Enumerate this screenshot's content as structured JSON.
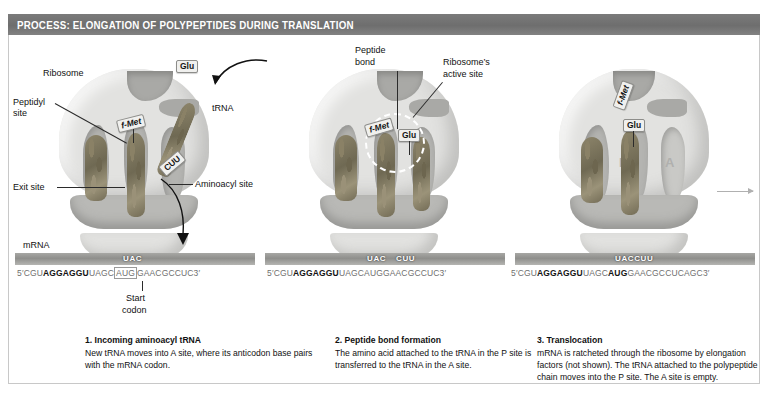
{
  "header": {
    "title": "PROCESS: ELONGATION OF POLYPEPTIDES DURING TRANSLATION"
  },
  "sites": {
    "e": "E",
    "p": "P",
    "a": "A"
  },
  "panel1": {
    "labels": {
      "ribosome": "Ribosome",
      "peptidyl_site_line1": "Peptidyl",
      "peptidyl_site_line2": "site",
      "exit_site": "Exit site",
      "mrna": "mRNA",
      "trna": "tRNA",
      "aminoacyl_site": "Aminoacyl site",
      "start_codon_line1": "Start",
      "start_codon_line2": "codon"
    },
    "amino_acids": {
      "fmet": "f-Met",
      "glu": "Glu"
    },
    "anticodons": {
      "p_site": "UAC",
      "incoming": "CUU"
    },
    "mrna_sequence": {
      "five_prime": "5′",
      "leader": "CGU",
      "shine_dalgarno": "AGGAGGU",
      "spacer": "UAGC",
      "start_codon": "AUG",
      "tail": "GAACGCCUC",
      "three_prime": "3′"
    },
    "caption_title": "1. Incoming aminoacyl tRNA",
    "caption_body": "New tRNA moves into A site, where its anticodon base pairs with the mRNA codon."
  },
  "panel2": {
    "labels": {
      "peptide_bond_line1": "Peptide",
      "peptide_bond_line2": "bond",
      "active_site_line1": "Ribosome’s",
      "active_site_line2": "active site"
    },
    "amino_acids": {
      "fmet": "f-Met",
      "glu": "Glu"
    },
    "anticodons": {
      "p_site": "UAC",
      "a_site": "CUU"
    },
    "mrna_sequence": {
      "five_prime": "5′",
      "leader": "CGU",
      "shine_dalgarno": "AGGAGGU",
      "spacer": "UAGC",
      "start_codon": "AUG",
      "tail": "GAACGCCUC",
      "three_prime": "3′"
    },
    "caption_title": "2. Peptide bond formation",
    "caption_body": "The amino acid attached to the tRNA in the P site is transferred to the tRNA in the A site."
  },
  "panel3": {
    "amino_acids": {
      "fmet": "f-Met",
      "glu": "Glu"
    },
    "anticodons": {
      "joined": "UACCUU"
    },
    "mrna_sequence": {
      "five_prime": "5′",
      "leader": "CGU",
      "shine_dalgarno": "AGGAGGU",
      "spacer": "UAGC",
      "start_codon": "AUG",
      "tail": "GAACGCCUCAGC",
      "three_prime": "3′"
    },
    "caption_title": "3. Translocation",
    "caption_body": "mRNA is ratcheted through the ribosome by elongation factors (not shown). The tRNA attached to the polypeptide chain moves into the P site. The A site is empty."
  },
  "colors": {
    "header_bar": "#6e6e6e",
    "ribosome_large": "#e2e2e0",
    "ribosome_small": "#b9b9b6",
    "trna": "#8d856b",
    "site_letter": "#b0b0ae"
  }
}
